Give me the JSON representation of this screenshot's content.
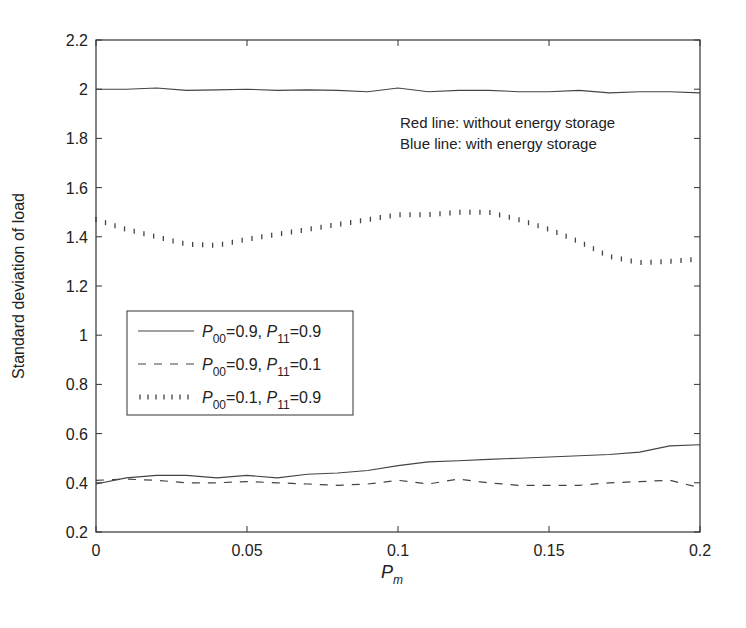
{
  "chart_data": {
    "type": "line",
    "title": "",
    "xlabel": "P_m",
    "ylabel": "Standard deviation of load",
    "xlim": [
      0,
      0.2
    ],
    "ylim": [
      0.2,
      2.2
    ],
    "xticks": [
      0,
      0.05,
      0.1,
      0.15,
      0.2
    ],
    "xtick_labels": [
      "0",
      "0.05",
      "0.1",
      "0.15",
      "0.2"
    ],
    "yticks": [
      0.2,
      0.4,
      0.6,
      0.8,
      1.0,
      1.2,
      1.4,
      1.6,
      1.8,
      2.0,
      2.2
    ],
    "ytick_labels": [
      "0.2",
      "0.4",
      "0.6",
      "0.8",
      "1",
      "1.2",
      "1.4",
      "1.6",
      "1.8",
      "2",
      "2.2"
    ],
    "grid": false,
    "legend_position": "center-left",
    "annotations": [
      "Red line: without energy storage",
      "Blue line: with energy storage"
    ],
    "x": [
      0,
      0.01,
      0.02,
      0.03,
      0.04,
      0.05,
      0.06,
      0.07,
      0.08,
      0.09,
      0.1,
      0.11,
      0.12,
      0.13,
      0.14,
      0.15,
      0.16,
      0.17,
      0.18,
      0.19,
      0.2
    ],
    "series": [
      {
        "name": "P00=0.9, P11=0.9 (without energy storage)",
        "style": "solid",
        "values": [
          2.0,
          2.0,
          2.005,
          1.995,
          1.997,
          2.0,
          1.995,
          1.997,
          1.995,
          1.99,
          2.005,
          1.99,
          1.995,
          1.995,
          1.99,
          1.99,
          1.995,
          1.985,
          1.99,
          1.99,
          1.985
        ]
      },
      {
        "name": "P00=0.1, P11=0.9 (with energy storage)",
        "style": "dotted",
        "values": [
          1.47,
          1.43,
          1.4,
          1.37,
          1.365,
          1.39,
          1.41,
          1.43,
          1.45,
          1.47,
          1.49,
          1.49,
          1.5,
          1.5,
          1.47,
          1.43,
          1.38,
          1.32,
          1.295,
          1.3,
          1.31
        ]
      },
      {
        "name": "P00=0.9, P11=0.9 (with energy storage)",
        "style": "solid",
        "values": [
          0.395,
          0.42,
          0.43,
          0.43,
          0.42,
          0.43,
          0.42,
          0.435,
          0.44,
          0.45,
          0.47,
          0.485,
          0.49,
          0.495,
          0.5,
          0.505,
          0.51,
          0.515,
          0.525,
          0.55,
          0.555
        ]
      },
      {
        "name": "P00=0.9, P11=0.1 (with energy storage)",
        "style": "dashed",
        "values": [
          0.41,
          0.415,
          0.41,
          0.4,
          0.4,
          0.405,
          0.4,
          0.395,
          0.39,
          0.395,
          0.41,
          0.395,
          0.415,
          0.4,
          0.39,
          0.39,
          0.39,
          0.4,
          0.405,
          0.41,
          0.38
        ]
      }
    ],
    "legend": [
      {
        "style": "solid",
        "label_parts": [
          "P",
          "00",
          "=0.9, ",
          "P",
          "11",
          "=0.9"
        ]
      },
      {
        "style": "dashed",
        "label_parts": [
          "P",
          "00",
          "=0.9, ",
          "P",
          "11",
          "=0.1"
        ]
      },
      {
        "style": "dotted",
        "label_parts": [
          "P",
          "00",
          "=0.1, ",
          "P",
          "11",
          "=0.9"
        ]
      }
    ]
  },
  "labels": {
    "xlabel_main": "P",
    "xlabel_sub": "m",
    "ylabel": "Standard deviation of load",
    "anno1": "Red line: without energy storage",
    "anno2": "Blue line: with energy storage"
  }
}
